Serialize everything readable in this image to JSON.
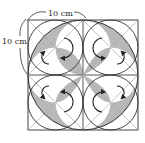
{
  "diagram": {
    "type": "geometric-figure",
    "labels": {
      "top_dimension": "10 cm",
      "left_dimension": "10 cm"
    },
    "square": {
      "x": 28,
      "y": 20,
      "size": 110
    },
    "colors": {
      "stroke": "#333333",
      "diagonal": "#aaaaaa",
      "shade": "#b8b8b8",
      "background": "#ffffff"
    },
    "arrows": 8,
    "shaded_regions": [
      "4 crescents between large circle and small circles",
      "4 petal lenses along diagonals"
    ]
  }
}
